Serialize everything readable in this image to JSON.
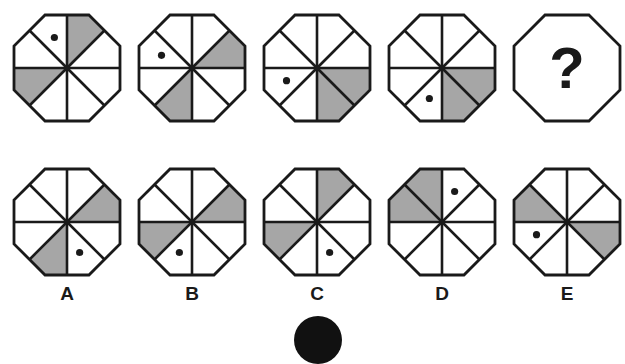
{
  "puzzle": {
    "sector_convention": "sectors numbered 0-7 clockwise starting at top-right (between 12 o'clock line and NE diagonal)",
    "colors": {
      "shade": "#a6a6a6",
      "stroke": "#1a1a1a",
      "dot": "#1a1a1a",
      "background": "#ffffff"
    },
    "sequence": [
      {
        "id": "seq-1",
        "shaded": [
          0,
          5
        ],
        "dot": 7
      },
      {
        "id": "seq-2",
        "shaded": [
          1,
          4
        ],
        "dot": 6
      },
      {
        "id": "seq-3",
        "shaded": [
          2,
          3
        ],
        "dot": 5
      },
      {
        "id": "seq-4",
        "shaded": [
          2,
          3
        ],
        "dot": 4
      },
      {
        "id": "seq-5",
        "question": "?"
      }
    ],
    "options": [
      {
        "label": "A",
        "shaded": [
          1,
          4
        ],
        "dot": 3
      },
      {
        "label": "B",
        "shaded": [
          1,
          5
        ],
        "dot": 4
      },
      {
        "label": "C",
        "shaded": [
          0,
          5
        ],
        "dot": 3
      },
      {
        "label": "D",
        "shaded": [
          6,
          7
        ],
        "dot": 0
      },
      {
        "label": "E",
        "shaded": [
          2,
          6
        ],
        "dot": 5
      }
    ]
  }
}
